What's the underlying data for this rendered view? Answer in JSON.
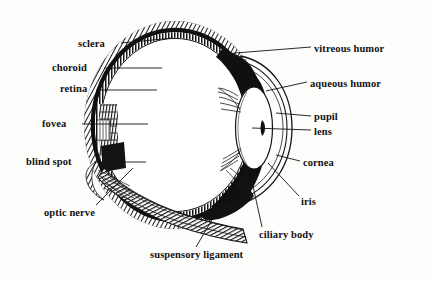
{
  "figure": {
    "style": "line-engraving",
    "background_color": "#fdfdfc",
    "ink_color": "#121212"
  },
  "labels": [
    {
      "id": "sclera",
      "text": "sclera",
      "x": 78,
      "y": 45,
      "align": "right",
      "anchor_x": 120,
      "anchor_y": 45
    },
    {
      "id": "choroid",
      "text": "choroid",
      "x": 52,
      "y": 69,
      "align": "right",
      "anchor_x": 120,
      "anchor_y": 69
    },
    {
      "id": "retina",
      "text": "retina",
      "x": 60,
      "y": 90,
      "align": "right",
      "anchor_x": 120,
      "anchor_y": 90
    },
    {
      "id": "fovea",
      "text": "fovea",
      "x": 42,
      "y": 125,
      "align": "right",
      "anchor_x": 112,
      "anchor_y": 125
    },
    {
      "id": "blind-spot",
      "text": "blind spot",
      "x": 26,
      "y": 163,
      "align": "right",
      "anchor_x": 110,
      "anchor_y": 163
    },
    {
      "id": "optic-nerve",
      "text": "optic nerve",
      "x": 44,
      "y": 214,
      "align": "left",
      "anchor_x": 125,
      "anchor_y": 178
    },
    {
      "id": "suspensory-ligament",
      "text": "suspensory ligament",
      "x": 150,
      "y": 256,
      "align": "left",
      "anchor_x": 238,
      "anchor_y": 170
    },
    {
      "id": "ciliary-body",
      "text": "ciliary body",
      "x": 259,
      "y": 236,
      "align": "left",
      "anchor_x": 255,
      "anchor_y": 188
    },
    {
      "id": "iris",
      "text": "iris",
      "x": 301,
      "y": 203,
      "align": "left",
      "anchor_x": 272,
      "anchor_y": 172
    },
    {
      "id": "cornea",
      "text": "cornea",
      "x": 303,
      "y": 164,
      "align": "left",
      "anchor_x": 277,
      "anchor_y": 155
    },
    {
      "id": "lens",
      "text": "lens",
      "x": 314,
      "y": 133,
      "align": "left",
      "anchor_x": 258,
      "anchor_y": 128
    },
    {
      "id": "pupil",
      "text": "pupil",
      "x": 314,
      "y": 118,
      "align": "left",
      "anchor_x": 275,
      "anchor_y": 112
    },
    {
      "id": "aqueous-humor",
      "text": "aqueous humor",
      "x": 310,
      "y": 85,
      "align": "left",
      "anchor_x": 266,
      "anchor_y": 90
    },
    {
      "id": "vitreous-humor",
      "text": "vitreous humor",
      "x": 314,
      "y": 50,
      "align": "left",
      "anchor_x": 224,
      "anchor_y": 56
    }
  ],
  "leader_lines": [
    {
      "id": "leader-sclera",
      "x1": 121,
      "y1": 43,
      "x2": 173,
      "y2": 38
    },
    {
      "id": "leader-choroid",
      "x1": 104,
      "y1": 68,
      "x2": 162,
      "y2": 68
    },
    {
      "id": "leader-retina",
      "x1": 96,
      "y1": 90,
      "x2": 157,
      "y2": 90
    },
    {
      "id": "leader-fovea",
      "x1": 82,
      "y1": 124,
      "x2": 148,
      "y2": 124
    },
    {
      "id": "leader-blind-spot",
      "x1": 94,
      "y1": 162,
      "x2": 146,
      "y2": 162
    },
    {
      "id": "leader-optic-nerve",
      "x1": 96,
      "y1": 205,
      "x2": 133,
      "y2": 168
    },
    {
      "id": "leader-suspensory",
      "x1": 196,
      "y1": 247,
      "x2": 240,
      "y2": 172
    },
    {
      "id": "leader-ciliary",
      "x1": 262,
      "y1": 227,
      "x2": 253,
      "y2": 186
    },
    {
      "id": "leader-iris",
      "x1": 299,
      "y1": 196,
      "x2": 268,
      "y2": 163
    },
    {
      "id": "leader-cornea",
      "x1": 300,
      "y1": 161,
      "x2": 276,
      "y2": 155
    },
    {
      "id": "leader-lens",
      "x1": 311,
      "y1": 130,
      "x2": 252,
      "y2": 128
    },
    {
      "id": "leader-pupil",
      "x1": 311,
      "y1": 116,
      "x2": 276,
      "y2": 113
    },
    {
      "id": "leader-aqueous",
      "x1": 307,
      "y1": 82,
      "x2": 266,
      "y2": 91
    },
    {
      "id": "leader-vitreous",
      "x1": 311,
      "y1": 47,
      "x2": 223,
      "y2": 54
    }
  ],
  "structures": {
    "globe": {
      "center_x": 175,
      "center_y": 125,
      "radius_x": 85,
      "radius_y": 98
    },
    "lens": {
      "center_x": 254,
      "center_y": 128,
      "radius_x": 18,
      "radius_y": 41
    },
    "cornea": {
      "note": "thin double arc bulging right from y=55 to y=205"
    },
    "optic_nerve": {
      "note": "hatched band leaving lower-left wall toward lower-right"
    },
    "wall_layers": [
      "sclera (outer, hatched)",
      "choroid (middle, solid black)",
      "retina (inner, stippled)"
    ]
  }
}
